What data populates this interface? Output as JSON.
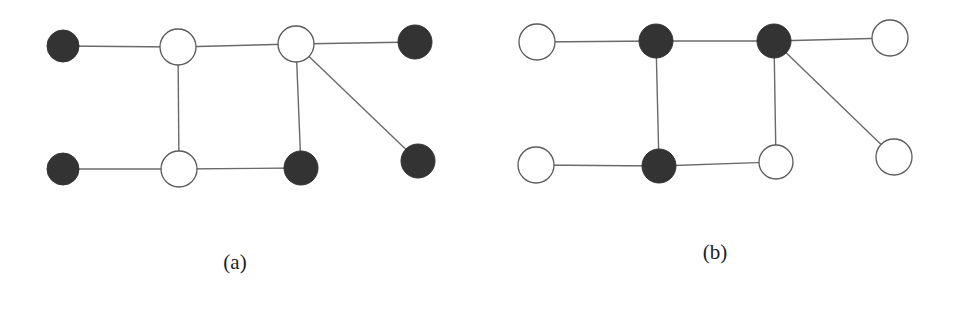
{
  "figure": {
    "colors": {
      "dark_node": "#333333",
      "light_node": "#ffffff",
      "edge": "#6a6a6a",
      "outline": "#5a5a5a"
    },
    "panels": [
      {
        "id": "a",
        "caption": "(a)",
        "caption_pos": {
          "x": 235,
          "y": 250
        },
        "nodes": [
          {
            "id": "a1",
            "x": 63,
            "y": 46,
            "r": 16,
            "fill": "dark"
          },
          {
            "id": "a2",
            "x": 178,
            "y": 47,
            "r": 18,
            "fill": "light"
          },
          {
            "id": "a3",
            "x": 296,
            "y": 44,
            "r": 18,
            "fill": "light"
          },
          {
            "id": "a4",
            "x": 415,
            "y": 42,
            "r": 17,
            "fill": "dark"
          },
          {
            "id": "a5",
            "x": 63,
            "y": 169,
            "r": 16,
            "fill": "dark"
          },
          {
            "id": "a6",
            "x": 179,
            "y": 169,
            "r": 18,
            "fill": "light"
          },
          {
            "id": "a7",
            "x": 301,
            "y": 168,
            "r": 17,
            "fill": "dark"
          },
          {
            "id": "a8",
            "x": 418,
            "y": 161,
            "r": 17,
            "fill": "dark"
          }
        ],
        "edges": [
          [
            "a1",
            "a2"
          ],
          [
            "a2",
            "a3"
          ],
          [
            "a3",
            "a4"
          ],
          [
            "a2",
            "a6"
          ],
          [
            "a3",
            "a7"
          ],
          [
            "a3",
            "a8"
          ],
          [
            "a5",
            "a6"
          ],
          [
            "a6",
            "a7"
          ]
        ]
      },
      {
        "id": "b",
        "caption": "(b)",
        "caption_pos": {
          "x": 715,
          "y": 240
        },
        "nodes": [
          {
            "id": "b1",
            "x": 537,
            "y": 42,
            "r": 18,
            "fill": "light"
          },
          {
            "id": "b2",
            "x": 656,
            "y": 41,
            "r": 17,
            "fill": "dark"
          },
          {
            "id": "b3",
            "x": 774,
            "y": 41,
            "r": 17,
            "fill": "dark"
          },
          {
            "id": "b4",
            "x": 890,
            "y": 38,
            "r": 18,
            "fill": "light"
          },
          {
            "id": "b5",
            "x": 536,
            "y": 165,
            "r": 18,
            "fill": "light"
          },
          {
            "id": "b6",
            "x": 659,
            "y": 166,
            "r": 17,
            "fill": "dark"
          },
          {
            "id": "b7",
            "x": 776,
            "y": 162,
            "r": 17,
            "fill": "light"
          },
          {
            "id": "b8",
            "x": 894,
            "y": 157,
            "r": 18,
            "fill": "light"
          }
        ],
        "edges": [
          [
            "b1",
            "b2"
          ],
          [
            "b2",
            "b3"
          ],
          [
            "b3",
            "b4"
          ],
          [
            "b2",
            "b6"
          ],
          [
            "b3",
            "b7"
          ],
          [
            "b3",
            "b8"
          ],
          [
            "b5",
            "b6"
          ],
          [
            "b6",
            "b7"
          ]
        ]
      }
    ]
  }
}
